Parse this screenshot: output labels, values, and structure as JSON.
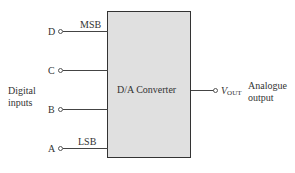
{
  "converter": {
    "title": "D/A Converter"
  },
  "inputs": {
    "group_label_line1": "Digital",
    "group_label_line2": "inputs",
    "msb_label": "MSB",
    "lsb_label": "LSB",
    "pins": [
      {
        "name": "D"
      },
      {
        "name": "C"
      },
      {
        "name": "B"
      },
      {
        "name": "A"
      }
    ]
  },
  "output": {
    "symbol": "V",
    "symbol_sub": "OUT",
    "label_line1": "Analogue",
    "label_line2": "output"
  }
}
